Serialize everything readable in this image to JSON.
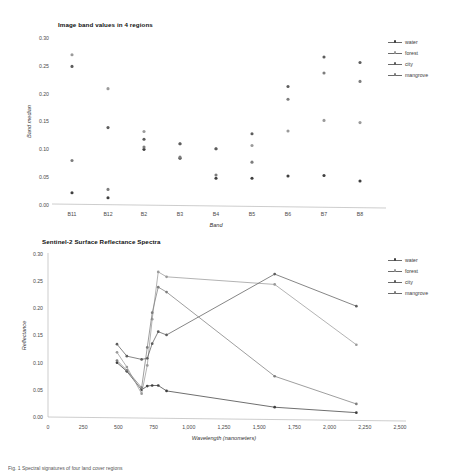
{
  "series_names": [
    "water",
    "forest",
    "city",
    "mangrove"
  ],
  "series_colors": [
    "#3f3f3f",
    "#9a9a9a",
    "#5d5d5d",
    "#7d7d7d"
  ],
  "legend": {
    "items": [
      {
        "label": "water",
        "color": "#3f3f3f"
      },
      {
        "label": "forest",
        "color": "#9a9a9a"
      },
      {
        "label": "city",
        "color": "#5d5d5d"
      },
      {
        "label": "mangrove",
        "color": "#7d7d7d"
      }
    ]
  },
  "caption": "Fig. 1  Spectral signatures of four land cover regions",
  "chart_data": [
    {
      "type": "scatter",
      "title": "Image band values in 4 regions",
      "xlabel": "Band",
      "ylabel": "Band median",
      "categories": [
        "B11",
        "B12",
        "B2",
        "B3",
        "B4",
        "B5",
        "B6",
        "B7",
        "B8"
      ],
      "ylim": [
        0.0,
        0.3
      ],
      "yticks": [
        "0.00",
        "0.05",
        "0.10",
        "0.15",
        "0.20",
        "0.25",
        "0.30"
      ],
      "ytick_values": [
        0.0,
        0.05,
        0.1,
        0.15,
        0.2,
        0.25,
        0.3
      ],
      "grid": false,
      "legend_position": "right",
      "series": [
        {
          "name": "water",
          "color": "#3f3f3f",
          "values": [
            0.022,
            0.013,
            0.1,
            0.084,
            0.048,
            0.048,
            0.052,
            0.053,
            0.043
          ]
        },
        {
          "name": "forest",
          "color": "#9a9a9a",
          "values": [
            0.27,
            0.209,
            0.132,
            0.11,
            0.101,
            0.107,
            0.133,
            0.152,
            0.148
          ]
        },
        {
          "name": "city",
          "color": "#5d5d5d",
          "values": [
            0.249,
            0.139,
            0.118,
            0.11,
            0.101,
            0.128,
            0.213,
            0.266,
            0.256
          ]
        },
        {
          "name": "mangrove",
          "color": "#7d7d7d",
          "values": [
            0.08,
            0.028,
            0.104,
            0.086,
            0.054,
            0.077,
            0.19,
            0.237,
            0.222
          ]
        }
      ]
    },
    {
      "type": "line",
      "title": "Sentinel-2  Surface Reflectance Spectra",
      "xlabel": "Wavelength (nanometers)",
      "ylabel": "Reflectance",
      "xlim": [
        0,
        2500
      ],
      "ylim": [
        0.0,
        0.3
      ],
      "xticks": [
        "0",
        "250",
        "500",
        "750",
        "1,000",
        "1,250",
        "1,500",
        "1,750",
        "2,000",
        "2,250",
        "2,500"
      ],
      "xtick_values": [
        0,
        250,
        500,
        750,
        1000,
        1250,
        1500,
        1750,
        2000,
        2250,
        2500
      ],
      "yticks": [
        "0.00",
        "0.05",
        "0.10",
        "0.15",
        "0.20",
        "0.25",
        "0.30"
      ],
      "ytick_values": [
        0.0,
        0.05,
        0.1,
        0.15,
        0.2,
        0.25,
        0.3
      ],
      "grid": false,
      "legend_position": "right",
      "x": [
        490,
        560,
        665,
        705,
        740,
        783,
        842,
        1610,
        2190
      ],
      "series": [
        {
          "name": "water",
          "color": "#3f3f3f",
          "values": [
            0.1,
            0.084,
            0.05,
            0.057,
            0.058,
            0.058,
            0.048,
            0.018,
            0.008
          ]
        },
        {
          "name": "forest",
          "color": "#9a9a9a",
          "values": [
            0.119,
            0.092,
            0.043,
            0.095,
            0.18,
            0.267,
            0.258,
            0.244,
            0.133
          ]
        },
        {
          "name": "city",
          "color": "#5d5d5d",
          "values": [
            0.134,
            0.112,
            0.106,
            0.108,
            0.135,
            0.157,
            0.151,
            0.263,
            0.204
          ]
        },
        {
          "name": "mangrove",
          "color": "#7d7d7d",
          "values": [
            0.104,
            0.086,
            0.054,
            0.128,
            0.192,
            0.239,
            0.23,
            0.075,
            0.024
          ]
        }
      ]
    }
  ]
}
